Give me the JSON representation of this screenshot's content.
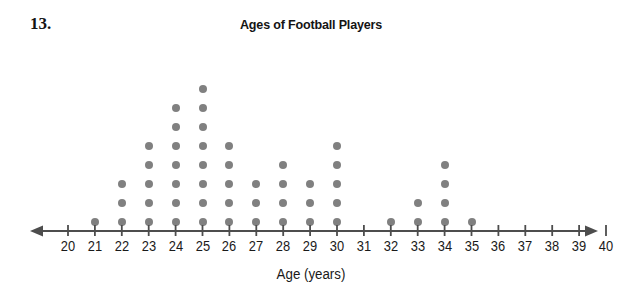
{
  "problem": {
    "number": "13."
  },
  "chart_data": {
    "type": "scatter",
    "plot_style": "dot-plot",
    "title": "Ages of Football Players",
    "xlabel": "Age (years)",
    "ylabel": "",
    "grid": false,
    "legend": null,
    "axis_arrows": "both",
    "xlim": [
      20,
      40
    ],
    "categories": [
      20,
      21,
      22,
      23,
      24,
      25,
      26,
      27,
      28,
      29,
      30,
      31,
      32,
      33,
      34,
      35,
      36,
      37,
      38,
      39,
      40
    ],
    "tick_labels": [
      "20",
      "21",
      "22",
      "23",
      "24",
      "25",
      "26",
      "27",
      "28",
      "29",
      "30",
      "31",
      "32",
      "33",
      "34",
      "35",
      "36",
      "37",
      "38",
      "39",
      "40"
    ],
    "values": [
      0,
      1,
      3,
      5,
      7,
      8,
      5,
      3,
      4,
      3,
      5,
      0,
      1,
      2,
      4,
      1,
      0,
      0,
      0,
      0,
      0
    ],
    "total_dots": 52,
    "dot_color": "#808080",
    "axis_color": "#4d4d4d",
    "max_stack": 8
  }
}
